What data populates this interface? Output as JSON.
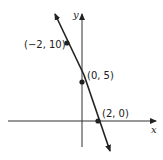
{
  "graph": {
    "axes": {
      "x_label": "x",
      "y_label": "y"
    },
    "line": {
      "equation_implied": "y = -5x + 5",
      "color": "#222222"
    },
    "points": [
      {
        "label": "(−2, 10)",
        "x": -2,
        "y": 10
      },
      {
        "label": "(0, 5)",
        "x": 0,
        "y": 5
      },
      {
        "label": "(2, 0)",
        "x": 2,
        "y": 0
      }
    ]
  }
}
